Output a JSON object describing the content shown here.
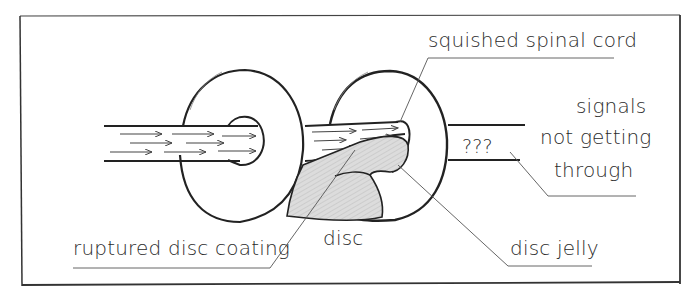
{
  "diagram": {
    "labels": {
      "squished_spinal_cord": "squished spinal cord",
      "signals_line1": "signals",
      "signals_line2": "not getting",
      "signals_line3": "through",
      "question_marks": "???",
      "ruptured_disc_coating": "ruptured disc coating",
      "disc": "disc",
      "disc_jelly": "disc jelly"
    },
    "colors": {
      "ink": "#222222",
      "leader_line": "#555555",
      "jelly_fill": "#d6d6d6",
      "frame": "#333333",
      "background": "#ffffff"
    }
  }
}
